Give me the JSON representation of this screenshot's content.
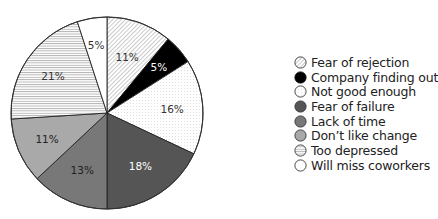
{
  "chart_data": {
    "type": "pie",
    "title": "",
    "start_angle_deg": 0,
    "direction": "clockwise",
    "legend_position": "right",
    "categories": [
      "Fear of rejection",
      "Company finding out",
      "Not good enough",
      "Fear of failure",
      "Lack of time",
      "Don't like change",
      "Too depressed",
      "Will miss coworkers"
    ],
    "values": [
      11,
      5,
      16,
      18,
      13,
      11,
      21,
      5
    ],
    "labels": [
      "11%",
      "5%",
      "16%",
      "18%",
      "13%",
      "11%",
      "21%",
      "5%"
    ],
    "fills": [
      {
        "pattern": "diagonal-hatch",
        "base": "#ffffff",
        "line": "#8a8a8a"
      },
      {
        "pattern": "solid",
        "base": "#000000"
      },
      {
        "pattern": "dots",
        "base": "#ffffff",
        "line": "#bdbdbd"
      },
      {
        "pattern": "solid",
        "base": "#555555"
      },
      {
        "pattern": "solid",
        "base": "#787878"
      },
      {
        "pattern": "solid",
        "base": "#a9a9a9"
      },
      {
        "pattern": "horizontal-lines",
        "base": "#ffffff",
        "line": "#9a9a9a"
      },
      {
        "pattern": "solid",
        "base": "#ffffff"
      }
    ],
    "label_colors": [
      "#333333",
      "#ffffff",
      "#333333",
      "#ffffff",
      "#222222",
      "#222222",
      "#333333",
      "#333333"
    ]
  },
  "legend": {
    "items": [
      {
        "label": "Fear of rejection"
      },
      {
        "label": "Company finding out"
      },
      {
        "label": "Not good enough"
      },
      {
        "label": "Fear of failure"
      },
      {
        "label": "Lack of time"
      },
      {
        "label": "Don’t like change"
      },
      {
        "label": "Too depressed"
      },
      {
        "label": "Will miss coworkers"
      }
    ]
  }
}
